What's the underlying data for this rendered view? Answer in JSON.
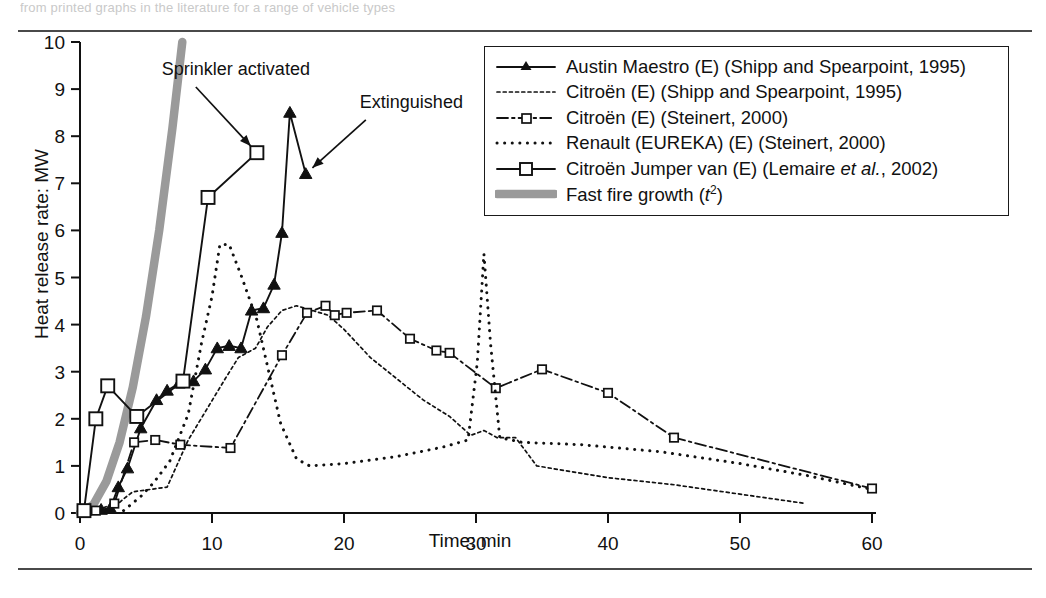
{
  "page": {
    "cropped_header_text": "from printed graphs in the literature for a range of vehicle types"
  },
  "axes": {
    "ylabel": "Heat release rate: MW",
    "xlabel": "Time: min",
    "yticks": [
      0,
      1,
      2,
      3,
      4,
      5,
      6,
      7,
      8,
      9,
      10
    ],
    "xticks": [
      0,
      10,
      20,
      30,
      40,
      50,
      60
    ]
  },
  "annotations": [
    {
      "name": "sprinkler-activated",
      "text": "Sprinkler activated",
      "x": 6.2,
      "y": 9.3,
      "point_x": 13.4,
      "point_y": 7.65
    },
    {
      "name": "extinguished",
      "text": "Extinguished",
      "x": 21.2,
      "y": 8.6,
      "point_x": 17.1,
      "point_y": 7.2
    }
  ],
  "legend": {
    "items": [
      {
        "name": "austin-maestro",
        "label": "Austin Maestro (E) (Shipp and Spearpoint, 1995)",
        "style": "solid-triangle"
      },
      {
        "name": "citroen-shipp",
        "label": "Citroën (E) (Shipp and Spearpoint, 1995)",
        "style": "fine-dashed"
      },
      {
        "name": "citroen-steinert",
        "label": "Citroën (E) (Steinert, 2000)",
        "style": "dash-dot-square"
      },
      {
        "name": "renault-eureka",
        "label": "Renault (EUREKA) (E) (Steinert, 2000)",
        "style": "coarse-dotted"
      },
      {
        "name": "citroen-jumper-van",
        "label": "Citroën Jumper van (E) (Lemaire et al., 2002)",
        "style": "solid-open-square"
      },
      {
        "name": "fast-fire-growth",
        "label": "Fast fire growth (t²)",
        "style": "thick-grey"
      }
    ]
  },
  "colors": {
    "curve": "#111111",
    "fast_fire_growth": "#9a9a9a",
    "axis": "#111111",
    "rule": "#4a4a4a"
  },
  "chart_data": {
    "type": "line",
    "title": "",
    "xlabel": "Time: min",
    "ylabel": "Heat release rate: MW",
    "xlim": [
      0,
      60
    ],
    "ylim": [
      0,
      10
    ],
    "grid": false,
    "legend_position": "top-right",
    "series": [
      {
        "name": "Austin Maestro (E) (Shipp and Spearpoint, 1995)",
        "style": "solid-triangle",
        "markers": true,
        "points": [
          [
            0.4,
            0.05
          ],
          [
            1.6,
            0.07
          ],
          [
            2.3,
            0.1
          ],
          [
            2.9,
            0.55
          ],
          [
            3.6,
            0.95
          ],
          [
            4.6,
            1.8
          ],
          [
            5.8,
            2.4
          ],
          [
            6.6,
            2.6
          ],
          [
            7.5,
            2.75
          ],
          [
            8.6,
            2.8
          ],
          [
            9.5,
            3.05
          ],
          [
            10.4,
            3.5
          ],
          [
            11.3,
            3.55
          ],
          [
            12.2,
            3.5
          ],
          [
            13.0,
            4.3
          ],
          [
            13.9,
            4.35
          ],
          [
            14.7,
            4.85
          ],
          [
            15.3,
            5.95
          ],
          [
            15.9,
            8.5
          ],
          [
            17.1,
            7.2
          ]
        ]
      },
      {
        "name": "Citroën (E) (Shipp and Spearpoint, 1995)",
        "style": "fine-dashed",
        "markers": false,
        "points": [
          [
            2.3,
            0.05
          ],
          [
            3.3,
            0.3
          ],
          [
            4.0,
            0.45
          ],
          [
            5.3,
            0.5
          ],
          [
            6.6,
            0.55
          ],
          [
            8.2,
            1.55
          ],
          [
            9.6,
            2.2
          ],
          [
            11.0,
            2.85
          ],
          [
            12.0,
            3.3
          ],
          [
            13.3,
            3.5
          ],
          [
            14.2,
            3.95
          ],
          [
            15.3,
            4.3
          ],
          [
            16.4,
            4.4
          ],
          [
            17.6,
            4.3
          ],
          [
            18.8,
            4.2
          ],
          [
            20.0,
            3.9
          ],
          [
            22.0,
            3.3
          ],
          [
            24.0,
            2.85
          ],
          [
            26.0,
            2.4
          ],
          [
            28.0,
            2.05
          ],
          [
            29.6,
            1.65
          ],
          [
            30.6,
            1.75
          ],
          [
            31.6,
            1.6
          ],
          [
            33.0,
            1.6
          ],
          [
            34.6,
            1.0
          ],
          [
            40.0,
            0.75
          ],
          [
            45.0,
            0.6
          ],
          [
            50.0,
            0.4
          ],
          [
            55.0,
            0.2
          ]
        ]
      },
      {
        "name": "Citroën (E) (Steinert, 2000)",
        "style": "dash-dot-square",
        "markers": true,
        "points": [
          [
            1.2,
            0.05
          ],
          [
            2.6,
            0.2
          ],
          [
            4.1,
            1.5
          ],
          [
            5.7,
            1.55
          ],
          [
            7.6,
            1.45
          ],
          [
            11.4,
            1.38
          ],
          [
            15.3,
            3.35
          ],
          [
            17.2,
            4.25
          ],
          [
            18.6,
            4.4
          ],
          [
            19.3,
            4.2
          ],
          [
            20.2,
            4.25
          ],
          [
            22.5,
            4.3
          ],
          [
            25.0,
            3.7
          ],
          [
            27.0,
            3.45
          ],
          [
            28.0,
            3.4
          ],
          [
            31.5,
            2.65
          ],
          [
            35.0,
            3.05
          ],
          [
            40.0,
            2.55
          ],
          [
            45.0,
            1.6
          ],
          [
            60.0,
            0.52
          ]
        ]
      },
      {
        "name": "Renault (EUREKA) (E) (Steinert, 2000)",
        "style": "coarse-dotted",
        "markers": false,
        "points": [
          [
            3.3,
            0.05
          ],
          [
            4.6,
            0.35
          ],
          [
            5.6,
            0.65
          ],
          [
            6.8,
            1.1
          ],
          [
            8.2,
            2.1
          ],
          [
            9.2,
            3.6
          ],
          [
            10.0,
            4.6
          ],
          [
            10.6,
            5.7
          ],
          [
            11.3,
            5.7
          ],
          [
            12.2,
            5.05
          ],
          [
            13.4,
            4.1
          ],
          [
            14.3,
            3.0
          ],
          [
            15.2,
            1.9
          ],
          [
            16.4,
            1.15
          ],
          [
            17.4,
            1.0
          ],
          [
            20.0,
            1.05
          ],
          [
            24.0,
            1.2
          ],
          [
            27.5,
            1.4
          ],
          [
            29.4,
            1.55
          ],
          [
            30.1,
            3.2
          ],
          [
            30.6,
            5.5
          ],
          [
            31.1,
            3.6
          ],
          [
            31.8,
            1.6
          ],
          [
            33.5,
            1.5
          ],
          [
            38.0,
            1.45
          ],
          [
            44.0,
            1.3
          ],
          [
            50.0,
            1.05
          ],
          [
            55.0,
            0.8
          ],
          [
            60.0,
            0.5
          ]
        ]
      },
      {
        "name": "Citroën Jumper van (E) (Lemaire et al., 2002)",
        "style": "solid-open-square",
        "markers": true,
        "points": [
          [
            0.3,
            0.05
          ],
          [
            1.2,
            2.0
          ],
          [
            2.1,
            2.7
          ],
          [
            4.3,
            2.05
          ],
          [
            7.8,
            2.8
          ],
          [
            9.7,
            6.7
          ],
          [
            13.4,
            7.65
          ]
        ]
      },
      {
        "name": "Fast fire growth (t²)",
        "style": "thick-grey",
        "markers": false,
        "points": [
          [
            0.0,
            0.0
          ],
          [
            1.0,
            0.17
          ],
          [
            2.0,
            0.67
          ],
          [
            3.0,
            1.5
          ],
          [
            4.0,
            2.67
          ],
          [
            5.0,
            4.17
          ],
          [
            6.0,
            6.0
          ],
          [
            7.0,
            8.17
          ],
          [
            7.75,
            10.0
          ]
        ]
      }
    ]
  }
}
